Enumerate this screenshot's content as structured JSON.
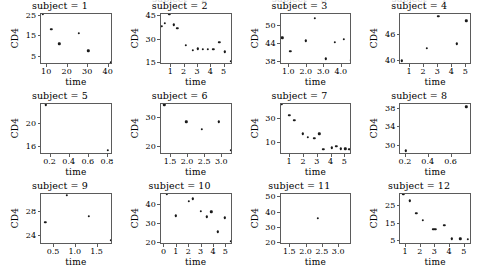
{
  "figure": {
    "width": 479,
    "height": 270,
    "background": "#ffffff",
    "foreground": "#000000",
    "axis_color": "#5b5b5b",
    "marker_color": "#1a1a1a",
    "rows": 3,
    "cols": 4,
    "xlabel": "time",
    "ylabel": "CD4",
    "clipped_top_row_note": "partial facet titles cut off at top edge"
  },
  "chart_data": {
    "type": "scatter",
    "title": "",
    "xlabel": "time",
    "ylabel": "CD4",
    "grid": false,
    "legend": null,
    "facets": [
      {
        "title": "subject = 1",
        "xlim": [
          7,
          42
        ],
        "ylim": [
          1,
          26
        ],
        "xticks": [
          10,
          20,
          30,
          40
        ],
        "xticklabels": [
          "10",
          "20",
          "30",
          "40"
        ],
        "yticks": [
          5,
          15,
          25
        ],
        "yticklabels": [
          "5",
          "15",
          "25"
        ],
        "x": [
          8.0,
          12.0,
          16.0,
          25.5,
          30.0,
          41.0
        ],
        "y": [
          25.0,
          17.5,
          10.5,
          15.5,
          7.0,
          1.5
        ]
      },
      {
        "title": "subject = 2",
        "xlim": [
          0.2,
          5.6
        ],
        "ylim": [
          14,
          46
        ],
        "xticks": [
          1,
          2,
          3,
          4,
          5
        ],
        "xticklabels": [
          "1",
          "2",
          "3",
          "4",
          "5"
        ],
        "yticks": [
          15,
          30,
          45
        ],
        "yticklabels": [
          "15",
          "30",
          "45"
        ],
        "x": [
          0.3,
          0.5,
          0.85,
          1.2,
          1.45,
          2.1,
          2.6,
          3.0,
          3.35,
          3.75,
          4.15,
          4.6,
          5.0,
          5.45
        ],
        "y": [
          37.0,
          39.0,
          45.0,
          38.0,
          36.0,
          25.0,
          22.0,
          23.0,
          22.5,
          22.5,
          22.5,
          27.0,
          21.0,
          15.0
        ]
      },
      {
        "title": "subject = 3",
        "xlim": [
          0.5,
          4.6
        ],
        "ylim": [
          37,
          54
        ],
        "xticks": [
          1.0,
          2.0,
          3.0,
          4.0
        ],
        "xticklabels": [
          "1.0",
          "2.0",
          "3.0",
          "4.0"
        ],
        "yticks": [
          38,
          44,
          50
        ],
        "yticklabels": [
          "38",
          "44",
          "50"
        ],
        "x": [
          0.6,
          1.05,
          1.95,
          2.45,
          3.1,
          3.6,
          4.1,
          4.5
        ],
        "y": [
          45.5,
          41.0,
          44.5,
          52.0,
          38.5,
          44.0,
          45.0,
          38.0
        ]
      },
      {
        "title": "subject = 4",
        "xlim": [
          0.3,
          5.4
        ],
        "ylim": [
          39,
          51
        ],
        "xticks": [
          1,
          2,
          3,
          4,
          5
        ],
        "xticklabels": [
          "1",
          "2",
          "3",
          "4",
          "5"
        ],
        "yticks": [
          40,
          46
        ],
        "yticklabels": [
          "40",
          "46"
        ],
        "x": [
          0.4,
          2.2,
          3.0,
          4.3,
          5.0
        ],
        "y": [
          39.5,
          42.5,
          50.0,
          43.5,
          49.0
        ]
      },
      {
        "title": "subject = 5",
        "xlim": [
          0.1,
          0.85
        ],
        "ylim": [
          14.5,
          23.5
        ],
        "xticks": [
          0.2,
          0.4,
          0.6,
          0.8
        ],
        "xticklabels": [
          "0.2",
          "0.4",
          "0.6",
          "0.8"
        ],
        "yticks": [
          16,
          20
        ],
        "yticklabels": [
          "16",
          "20"
        ],
        "x": [
          0.15,
          0.8
        ],
        "y": [
          23.0,
          15.0
        ]
      },
      {
        "title": "subject = 6",
        "xlim": [
          1.2,
          3.3
        ],
        "ylim": [
          17,
          35
        ],
        "xticks": [
          1.5,
          2.0,
          2.5,
          3.0
        ],
        "xticklabels": [
          "1.5",
          "2.0",
          "2.5",
          "3.0"
        ],
        "yticks": [
          20,
          30
        ],
        "yticklabels": [
          "20",
          "30"
        ],
        "x": [
          1.3,
          1.95,
          2.4,
          2.9,
          3.25
        ],
        "y": [
          34.0,
          28.0,
          25.5,
          28.0,
          18.0
        ]
      },
      {
        "title": "subject = 7",
        "xlim": [
          0.3,
          5.5
        ],
        "ylim": [
          0,
          42
        ],
        "xticks": [
          1,
          2,
          3,
          4,
          5
        ],
        "xticklabels": [
          "1",
          "2",
          "3",
          "4",
          "5"
        ],
        "yticks": [
          10,
          30
        ],
        "yticklabels": [
          "10",
          "30"
        ],
        "x": [
          0.4,
          0.95,
          1.3,
          1.9,
          2.3,
          2.75,
          3.1,
          3.4,
          4.0,
          4.35,
          4.65,
          5.0,
          5.3
        ],
        "y": [
          40.0,
          31.0,
          27.0,
          16.0,
          13.0,
          12.0,
          16.0,
          3.0,
          4.5,
          5.5,
          3.5,
          3.5,
          3.0
        ]
      },
      {
        "title": "subject = 8",
        "xlim": [
          0.15,
          0.78
        ],
        "ylim": [
          28,
          39
        ],
        "xticks": [
          0.2,
          0.4,
          0.6
        ],
        "xticklabels": [
          "0.2",
          "0.4",
          "0.6"
        ],
        "yticks": [
          30,
          34,
          38
        ],
        "yticklabels": [
          "30",
          "34",
          "38"
        ],
        "x": [
          0.2,
          0.73
        ],
        "y": [
          28.5,
          38.0
        ]
      },
      {
        "title": "subject = 9",
        "xlim": [
          0.2,
          1.85
        ],
        "ylim": [
          22.5,
          31
        ],
        "xticks": [
          0.5,
          1.0,
          1.5
        ],
        "xticklabels": [
          "0.5",
          "1.0",
          "1.5"
        ],
        "yticks": [
          24,
          28
        ],
        "yticklabels": [
          "24",
          "28"
        ],
        "x": [
          0.3,
          0.8,
          1.3,
          1.8
        ],
        "y": [
          26.0,
          30.5,
          27.0,
          23.0
        ]
      },
      {
        "title": "subject = 10",
        "xlim": [
          -0.3,
          5.5
        ],
        "ylim": [
          19,
          46
        ],
        "xticks": [
          0,
          1,
          2,
          3,
          4,
          5
        ],
        "xticklabels": [
          "0",
          "1",
          "2",
          "3",
          "4",
          "5"
        ],
        "yticks": [
          20,
          30,
          40
        ],
        "yticklabels": [
          "20",
          "30",
          "40"
        ],
        "x": [
          0.2,
          0.9,
          1.95,
          2.3,
          2.95,
          3.4,
          3.8,
          4.3,
          4.9,
          5.35
        ],
        "y": [
          45.0,
          33.5,
          41.0,
          42.5,
          36.0,
          33.0,
          35.5,
          25.0,
          32.5,
          20.0
        ]
      },
      {
        "title": "subject = 11",
        "xlim": [
          1.2,
          3.4
        ],
        "ylim": [
          19,
          52
        ],
        "xticks": [
          1.5,
          2.0,
          2.5,
          3.0
        ],
        "xticklabels": [
          "1.5",
          "2.0",
          "2.5",
          "3.0"
        ],
        "yticks": [
          20,
          30,
          40,
          50
        ],
        "yticklabels": [
          "20",
          "30",
          "40",
          "50"
        ],
        "x": [
          2.35
        ],
        "y": [
          35.0
        ]
      },
      {
        "title": "subject = 12",
        "xlim": [
          0.6,
          5.5
        ],
        "ylim": [
          3,
          32
        ],
        "xticks": [
          1,
          2,
          3,
          4,
          5
        ],
        "xticklabels": [
          "1",
          "2",
          "3",
          "4",
          "5"
        ],
        "yticks": [
          5,
          15,
          25
        ],
        "yticklabels": [
          "5",
          "15",
          "25"
        ],
        "x": [
          0.8,
          1.25,
          1.7,
          2.15,
          2.85,
          3.0,
          3.6,
          4.1,
          4.7,
          5.2
        ],
        "y": [
          31.0,
          27.0,
          20.0,
          16.0,
          11.0,
          11.0,
          13.0,
          5.5,
          5.5,
          5.0
        ]
      }
    ]
  }
}
